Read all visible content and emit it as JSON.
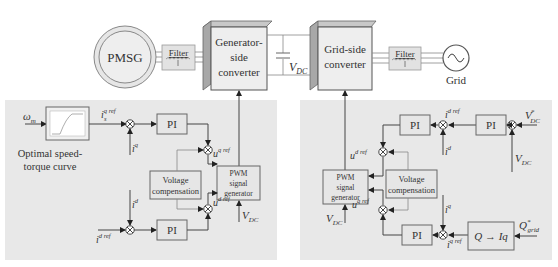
{
  "colors": {
    "panel_bg": "#e8e8e8",
    "block_fill": "#e6e6e6",
    "block_stroke": "#666666",
    "converter_front": "#eeeeee",
    "converter_side": "#a8a8a8",
    "line": "#444444",
    "background": "#ffffff"
  },
  "top": {
    "generator": {
      "label": "PMSG",
      "icon": "generator-circle-icon"
    },
    "filter_left": {
      "label": "Filter",
      "icon": "inductor-icon"
    },
    "gen_converter": {
      "line1": "Generator-",
      "line2": "side",
      "line3": "converter"
    },
    "dc_link": {
      "label_main": "V",
      "label_sub": "DC",
      "icon": "capacitor-icon"
    },
    "grid_converter": {
      "line1": "Grid-side",
      "line2": "converter"
    },
    "filter_right": {
      "label": "Filter",
      "icon": "inductor-icon"
    },
    "grid": {
      "label": "Grid",
      "icon": "ac-source-icon"
    }
  },
  "left_panel": {
    "input_omega": {
      "main": "ω",
      "sub": "m"
    },
    "curve_block": {
      "caption_line1": "Optimal speed-",
      "caption_line2": "torque curve",
      "icon": "speed-torque-curve-icon"
    },
    "isq_ref": {
      "main": "i",
      "sup": "q ref",
      "sub": "s"
    },
    "isq": {
      "main": "i",
      "sup": "q",
      "sub": "s"
    },
    "isd": {
      "main": "i",
      "sup": "d",
      "sub": "s"
    },
    "isd_ref": {
      "main": "i",
      "sup": "d ref",
      "sub": "s"
    },
    "pi_top": "PI",
    "pi_bottom": "PI",
    "usq_ref": {
      "main": "u",
      "sup": "q ref",
      "sub": "s"
    },
    "usd_ref": {
      "main": "u",
      "sup": "d ref",
      "sub": "s"
    },
    "voltage_comp": {
      "line1": "Voltage",
      "line2": "compensation"
    },
    "pwm": {
      "line1": "PWM",
      "line2": "signal",
      "line3": "generator"
    },
    "vdc": {
      "main": "V",
      "sub": "DC"
    }
  },
  "right_panel": {
    "pi_top_right": "PI",
    "pi_top_left": "PI",
    "pi_bottom": "PI",
    "vdc_star": {
      "main": "V",
      "sup": "*",
      "sub": "DC"
    },
    "vdc": {
      "main": "V",
      "sub": "DC"
    },
    "igd_ref": {
      "main": "i",
      "sup": "d ref",
      "sub": "g"
    },
    "igd": {
      "main": "i",
      "sup": "d",
      "sub": "g"
    },
    "igq": {
      "main": "i",
      "sup": "q",
      "sub": "g"
    },
    "igq_ref": {
      "main": "i",
      "sup": "q ref",
      "sub": "g"
    },
    "ugd_ref": {
      "main": "u",
      "sup": "d ref",
      "sub": "g"
    },
    "ugq_ref": {
      "main": "u",
      "sup": "q ref",
      "sub": "g"
    },
    "voltage_comp": {
      "line1": "Voltage",
      "line2": "compensation"
    },
    "pwm": {
      "line1": "PWM",
      "line2": "signal",
      "line3": "generator"
    },
    "vdc_pwm": {
      "main": "V",
      "sub": "DC"
    },
    "q_block": {
      "label": "Q → Iq"
    },
    "q_grid": {
      "main": "Q",
      "sup": "*",
      "sub": "grid"
    }
  }
}
